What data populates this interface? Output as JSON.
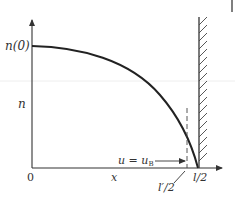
{
  "diagram": {
    "type": "density-profile",
    "colors": {
      "stroke": "#333333",
      "guide": "#e8e8e8"
    },
    "y_axis": {
      "label": "n",
      "top_label": "n(0)"
    },
    "x_axis": {
      "label": "x",
      "origin": "0",
      "end_label": "l/2"
    },
    "marker": {
      "label": "l′/2"
    },
    "annotation": {
      "text": "u = u",
      "subscript": "B"
    },
    "wall": {
      "description": "hatched wall at x = l/2"
    },
    "curve": {
      "description": "density n(x) decreasing from n(0) at x=0 to 0 at x=l/2"
    }
  }
}
